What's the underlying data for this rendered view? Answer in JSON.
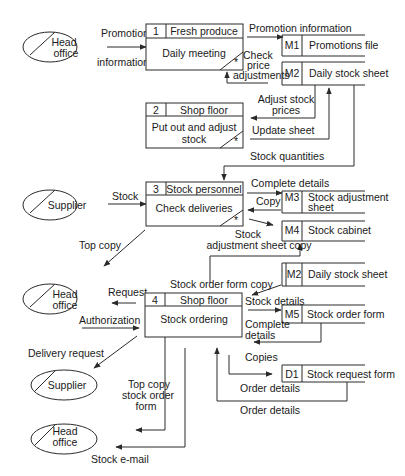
{
  "diagram": {
    "type": "data-flow-diagram",
    "processes": [
      {
        "id": "1",
        "owner": "Fresh produce",
        "name": "Daily meeting"
      },
      {
        "id": "2",
        "owner": "Shop floor",
        "name_line1": "Put out and adjust",
        "name_line2": "stock"
      },
      {
        "id": "3",
        "owner": "Stock personnel",
        "name": "Check deliveries"
      },
      {
        "id": "4",
        "owner": "Shop floor",
        "name": "Stock ordering"
      }
    ],
    "stores": [
      {
        "id": "M1",
        "name": "Promotions file"
      },
      {
        "id": "M2",
        "name": "Daily stock sheet"
      },
      {
        "id": "M3",
        "name_line1": "Stock adjustment",
        "name_line2": "sheet"
      },
      {
        "id": "M4",
        "name": "Stock cabinet"
      },
      {
        "id": "M2",
        "name": "Daily stock sheet"
      },
      {
        "id": "M5",
        "name": "Stock order form"
      },
      {
        "id": "D1",
        "name": "Stock request form"
      }
    ],
    "externals": [
      {
        "line1": "Head",
        "line2": "office"
      },
      {
        "line1": "Supplier"
      },
      {
        "line1": "Head",
        "line2": "office"
      },
      {
        "line1": "Supplier"
      },
      {
        "line1": "Head",
        "line2": "office"
      }
    ],
    "flows": {
      "promotion_top": "Promotion",
      "promotion_bottom": "information",
      "promotion_information": "Promotion information",
      "check_1": "Check",
      "check_2": "price",
      "check_3": "adjustments",
      "adjust_1": "Adjust stock",
      "adjust_2": "prices",
      "update_sheet": "Update sheet",
      "stock_quantities": "Stock quantities",
      "stock": "Stock",
      "complete_details": "Complete details",
      "copy": "Copy",
      "stock_adj_1": "Stock",
      "stock_adj_2": "adjustment sheet copy",
      "top_copy": "Top copy",
      "stock_order_form_copy": "Stock order form copy",
      "request": "Request",
      "authorization": "Authorization",
      "stock_details": "Stock details",
      "complete_details2_1": "Complete",
      "complete_details2_2": "details",
      "copies": "Copies",
      "delivery_request": "Delivery request",
      "top_copy_sof_1": "Top copy",
      "top_copy_sof_2": "stock order",
      "top_copy_sof_3": "form",
      "order_details_1": "Order details",
      "order_details_2": "Order details",
      "stock_email": "Stock e-mail"
    }
  }
}
